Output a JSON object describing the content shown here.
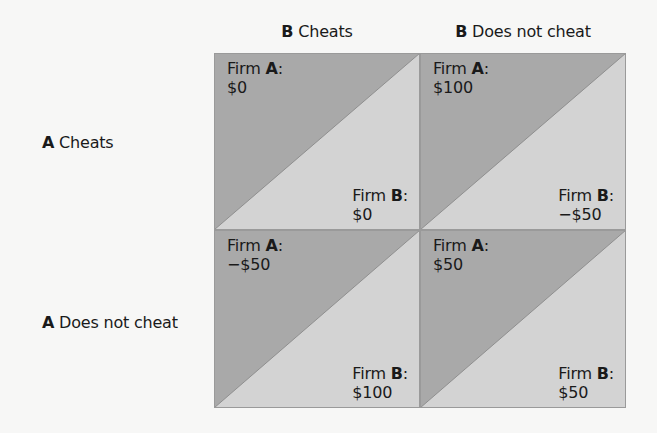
{
  "matrix": {
    "player_a": "A",
    "player_b": "B",
    "firm_prefix": "Firm",
    "columns": [
      {
        "player": "B",
        "strategy": "Cheats"
      },
      {
        "player": "B",
        "strategy": "Does not cheat"
      }
    ],
    "rows": [
      {
        "player": "A",
        "strategy": "Cheats"
      },
      {
        "player": "A",
        "strategy": "Does not cheat"
      }
    ],
    "cells": [
      [
        {
          "a_label": "A",
          "a_value": "$0",
          "b_label": "B",
          "b_value": "$0"
        },
        {
          "a_label": "A",
          "a_value": "$100",
          "b_label": "B",
          "b_value": "−$50"
        }
      ],
      [
        {
          "a_label": "A",
          "a_value": "−$50",
          "b_label": "B",
          "b_value": "$100"
        },
        {
          "a_label": "A",
          "a_value": "$50",
          "b_label": "B",
          "b_value": "$50"
        }
      ]
    ]
  },
  "colors": {
    "dark_triangle": "#a9a9a9",
    "light_triangle": "#d3d3d3",
    "border": "#9a9a9a",
    "background": "#f7f7f6"
  }
}
